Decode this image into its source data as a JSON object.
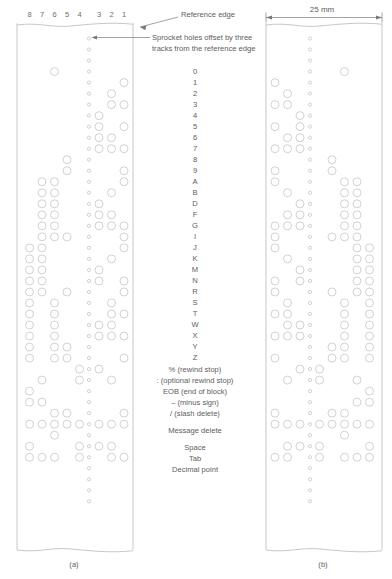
{
  "figure": {
    "caption_a": "(a)",
    "caption_b": "(b)",
    "dimension_label": "25 mm"
  },
  "annotations": {
    "reference_edge": "Reference edge",
    "sprocket_note_line1": "Sprocket holes offset by three",
    "sprocket_note_line2": "tracks from the reference edge"
  },
  "track_numbers": [
    "8",
    "7",
    "6",
    "5",
    "4",
    "3",
    "2",
    "1"
  ],
  "code_labels": [
    "0",
    "1",
    "2",
    "3",
    "4",
    "5",
    "6",
    "7",
    "8",
    "9",
    "A",
    "B",
    "D",
    "F",
    "G",
    "I",
    "J",
    "K",
    "M",
    "N",
    "R",
    "S",
    "T",
    "W",
    "X",
    "Y",
    "Z",
    "% (rewind stop)",
    ": (optional rewind stop)",
    "EOB (end of block)",
    "– (minus sign)",
    "/ (slash delete)",
    "Message delete",
    "Space",
    "Tab",
    "Decimal point"
  ],
  "colors": {
    "line": "#b9b9b9",
    "hole": "#c9c9c9",
    "text": "#5d5d5d",
    "leader": "#7a7a7a"
  },
  "chart_data": {
    "type": "table",
    "columns": [
      "track 8",
      "track 7",
      "track 6",
      "track 5",
      "track 4",
      "track 3",
      "track 2",
      "track 1"
    ],
    "note": "1 = hole punched, 0 = no hole. Sprocket hole present on every row, located between track 4 and track 3.",
    "rows": [
      {
        "label": "0",
        "bits": [
          0,
          0,
          1,
          0,
          0,
          0,
          0,
          0
        ]
      },
      {
        "label": "1",
        "bits": [
          0,
          0,
          0,
          0,
          0,
          0,
          0,
          1
        ]
      },
      {
        "label": "2",
        "bits": [
          0,
          0,
          0,
          0,
          0,
          0,
          1,
          0
        ]
      },
      {
        "label": "3",
        "bits": [
          0,
          0,
          0,
          0,
          0,
          0,
          1,
          1
        ]
      },
      {
        "label": "4",
        "bits": [
          0,
          0,
          0,
          0,
          0,
          1,
          0,
          0
        ]
      },
      {
        "label": "5",
        "bits": [
          0,
          0,
          0,
          0,
          0,
          1,
          0,
          1
        ]
      },
      {
        "label": "6",
        "bits": [
          0,
          0,
          0,
          0,
          0,
          1,
          1,
          0
        ]
      },
      {
        "label": "7",
        "bits": [
          0,
          0,
          0,
          0,
          0,
          1,
          1,
          1
        ]
      },
      {
        "label": "8",
        "bits": [
          0,
          0,
          0,
          1,
          0,
          0,
          0,
          0
        ]
      },
      {
        "label": "9",
        "bits": [
          0,
          0,
          0,
          1,
          0,
          0,
          0,
          1
        ]
      },
      {
        "label": "A",
        "bits": [
          0,
          1,
          1,
          0,
          0,
          0,
          0,
          1
        ]
      },
      {
        "label": "B",
        "bits": [
          0,
          1,
          1,
          0,
          0,
          0,
          1,
          0
        ]
      },
      {
        "label": "D",
        "bits": [
          0,
          1,
          1,
          0,
          0,
          1,
          0,
          0
        ]
      },
      {
        "label": "F",
        "bits": [
          0,
          1,
          1,
          0,
          0,
          1,
          1,
          0
        ]
      },
      {
        "label": "G",
        "bits": [
          0,
          1,
          1,
          0,
          0,
          1,
          1,
          1
        ]
      },
      {
        "label": "I",
        "bits": [
          0,
          1,
          1,
          1,
          0,
          0,
          0,
          1
        ]
      },
      {
        "label": "J",
        "bits": [
          1,
          1,
          0,
          0,
          0,
          0,
          0,
          1
        ]
      },
      {
        "label": "K",
        "bits": [
          1,
          1,
          0,
          0,
          0,
          0,
          1,
          0
        ]
      },
      {
        "label": "M",
        "bits": [
          1,
          1,
          0,
          0,
          0,
          1,
          0,
          0
        ]
      },
      {
        "label": "N",
        "bits": [
          1,
          1,
          0,
          0,
          0,
          1,
          0,
          1
        ]
      },
      {
        "label": "R",
        "bits": [
          1,
          1,
          0,
          1,
          0,
          0,
          0,
          1
        ]
      },
      {
        "label": "S",
        "bits": [
          1,
          0,
          1,
          0,
          0,
          0,
          1,
          0
        ]
      },
      {
        "label": "T",
        "bits": [
          1,
          0,
          1,
          0,
          0,
          0,
          1,
          1
        ]
      },
      {
        "label": "W",
        "bits": [
          1,
          0,
          1,
          0,
          0,
          1,
          1,
          0
        ]
      },
      {
        "label": "X",
        "bits": [
          1,
          0,
          1,
          0,
          0,
          1,
          1,
          1
        ]
      },
      {
        "label": "Y",
        "bits": [
          1,
          0,
          1,
          1,
          0,
          0,
          0,
          0
        ]
      },
      {
        "label": "Z",
        "bits": [
          1,
          0,
          1,
          1,
          0,
          0,
          0,
          1
        ]
      },
      {
        "label": "% (rewind stop)",
        "bits": [
          0,
          0,
          0,
          0,
          1,
          1,
          0,
          0
        ]
      },
      {
        "label": ": (optional rewind stop)",
        "bits": [
          0,
          1,
          0,
          0,
          1,
          0,
          1,
          0
        ]
      },
      {
        "label": "EOB (end of block)",
        "bits": [
          1,
          0,
          0,
          0,
          0,
          0,
          0,
          0
        ]
      },
      {
        "label": "– (minus sign)",
        "bits": [
          1,
          1,
          0,
          0,
          0,
          0,
          0,
          0
        ]
      },
      {
        "label": "/ (slash delete)",
        "bits": [
          0,
          0,
          1,
          1,
          0,
          0,
          0,
          1
        ]
      },
      {
        "label": "Message delete",
        "bits": [
          1,
          1,
          1,
          1,
          1,
          1,
          1,
          1
        ]
      },
      {
        "label": "Space",
        "bits": [
          0,
          0,
          1,
          0,
          0,
          0,
          0,
          0
        ]
      },
      {
        "label": "Tab",
        "bits": [
          1,
          0,
          0,
          0,
          1,
          1,
          1,
          0
        ]
      },
      {
        "label": "Decimal point",
        "bits": [
          1,
          1,
          1,
          0,
          1,
          0,
          1,
          1
        ]
      }
    ]
  }
}
